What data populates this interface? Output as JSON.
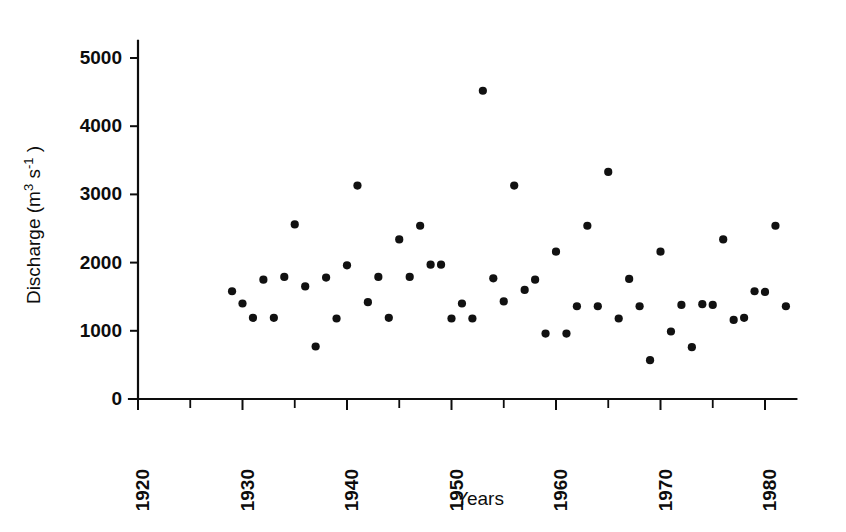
{
  "chart_data": {
    "type": "scatter",
    "title": "",
    "xlabel": "Years",
    "ylabel_text": "Discharge  (m",
    "ylabel_sup1": "3",
    "ylabel_mid": " s",
    "ylabel_sup2": "-1",
    "ylabel_close": " )",
    "ylabel_full": "Discharge (m3 s-1)",
    "xlim": [
      1918,
      1983
    ],
    "ylim": [
      0,
      5250
    ],
    "grid": false,
    "legend": "none",
    "marker": "filled-circle",
    "marker_color": "#111111",
    "xticks_major": [
      1920,
      1930,
      1940,
      1950,
      1960,
      1970,
      1980
    ],
    "xticks_major_labels": [
      "1920",
      "1930",
      "1940",
      "1950",
      "1960",
      "1970",
      "1980"
    ],
    "xticks_minor": [
      1925,
      1935,
      1945,
      1955,
      1965,
      1975
    ],
    "yticks": [
      0,
      1000,
      2000,
      3000,
      4000,
      5000
    ],
    "ytick_labels": [
      "0",
      "1000",
      "2000",
      "3000",
      "4000",
      "5000"
    ],
    "x": [
      1929,
      1930,
      1931,
      1932,
      1933,
      1934,
      1935,
      1936,
      1937,
      1938,
      1939,
      1940,
      1941,
      1942,
      1943,
      1944,
      1945,
      1946,
      1947,
      1948,
      1949,
      1950,
      1951,
      1952,
      1953,
      1954,
      1955,
      1956,
      1957,
      1958,
      1959,
      1960,
      1961,
      1962,
      1963,
      1964,
      1965,
      1966,
      1967,
      1968,
      1969,
      1970,
      1971,
      1972,
      1973,
      1974,
      1975,
      1976,
      1977,
      1978,
      1979,
      1980,
      1981,
      1982
    ],
    "y": [
      1580,
      1400,
      1190,
      1750,
      1190,
      1790,
      2560,
      1650,
      770,
      1780,
      1180,
      1960,
      3130,
      1420,
      1790,
      1190,
      2340,
      1790,
      2540,
      1970,
      1970,
      1180,
      1400,
      1180,
      4520,
      1770,
      1430,
      3130,
      1600,
      1750,
      960,
      2160,
      960,
      1360,
      2540,
      1360,
      3330,
      1180,
      1760,
      1360,
      570,
      2160,
      990,
      1380,
      760,
      1390,
      1380,
      2340,
      1160,
      1190,
      1580,
      1570,
      2540,
      1360
    ],
    "points": [
      {
        "year": 1929,
        "value": 1580
      },
      {
        "year": 1930,
        "value": 1400
      },
      {
        "year": 1931,
        "value": 1190
      },
      {
        "year": 1932,
        "value": 1750
      },
      {
        "year": 1933,
        "value": 1190
      },
      {
        "year": 1934,
        "value": 1790
      },
      {
        "year": 1935,
        "value": 2560
      },
      {
        "year": 1936,
        "value": 1650
      },
      {
        "year": 1937,
        "value": 770
      },
      {
        "year": 1938,
        "value": 1780
      },
      {
        "year": 1939,
        "value": 1180
      },
      {
        "year": 1940,
        "value": 1960
      },
      {
        "year": 1941,
        "value": 3130
      },
      {
        "year": 1942,
        "value": 1420
      },
      {
        "year": 1943,
        "value": 1790
      },
      {
        "year": 1944,
        "value": 1190
      },
      {
        "year": 1945,
        "value": 2340
      },
      {
        "year": 1946,
        "value": 1790
      },
      {
        "year": 1947,
        "value": 2540
      },
      {
        "year": 1948,
        "value": 1970
      },
      {
        "year": 1949,
        "value": 1970
      },
      {
        "year": 1950,
        "value": 1180
      },
      {
        "year": 1951,
        "value": 1400
      },
      {
        "year": 1952,
        "value": 1180
      },
      {
        "year": 1953,
        "value": 4520
      },
      {
        "year": 1954,
        "value": 1770
      },
      {
        "year": 1955,
        "value": 1430
      },
      {
        "year": 1956,
        "value": 3130
      },
      {
        "year": 1957,
        "value": 1600
      },
      {
        "year": 1958,
        "value": 1750
      },
      {
        "year": 1959,
        "value": 960
      },
      {
        "year": 1960,
        "value": 2160
      },
      {
        "year": 1961,
        "value": 960
      },
      {
        "year": 1962,
        "value": 1360
      },
      {
        "year": 1963,
        "value": 2540
      },
      {
        "year": 1964,
        "value": 1360
      },
      {
        "year": 1965,
        "value": 3330
      },
      {
        "year": 1966,
        "value": 1180
      },
      {
        "year": 1967,
        "value": 1760
      },
      {
        "year": 1968,
        "value": 1360
      },
      {
        "year": 1969,
        "value": 570
      },
      {
        "year": 1970,
        "value": 2160
      },
      {
        "year": 1971,
        "value": 990
      },
      {
        "year": 1972,
        "value": 1380
      },
      {
        "year": 1973,
        "value": 760
      },
      {
        "year": 1974,
        "value": 1390
      },
      {
        "year": 1975,
        "value": 1380
      },
      {
        "year": 1976,
        "value": 2340
      },
      {
        "year": 1977,
        "value": 1160
      },
      {
        "year": 1978,
        "value": 1190
      },
      {
        "year": 1979,
        "value": 1580
      },
      {
        "year": 1980,
        "value": 1570
      },
      {
        "year": 1981,
        "value": 2540
      },
      {
        "year": 1982,
        "value": 1360
      }
    ]
  }
}
